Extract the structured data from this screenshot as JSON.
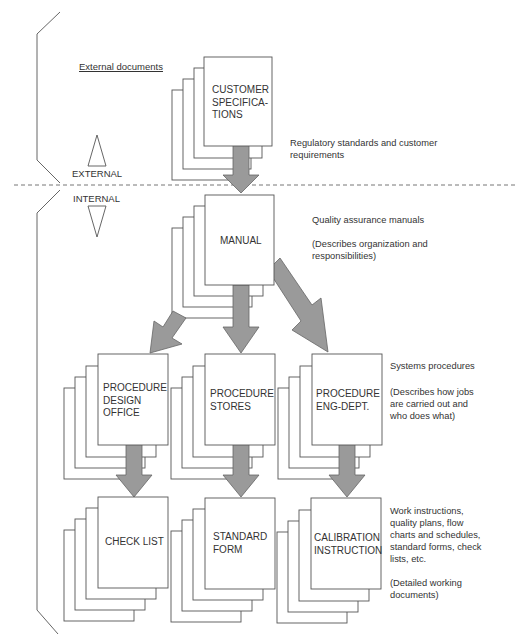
{
  "zones": {
    "external_label": "EXTERNAL",
    "internal_label": "INTERNAL",
    "external_documents_heading": "External documents"
  },
  "levels": [
    {
      "id": "external",
      "documents": [
        {
          "label_lines": [
            "CUSTOMER",
            "SPECIFICA-",
            "TIONS"
          ]
        }
      ],
      "description": "Regulatory standards and customer requirements",
      "description_lines": [
        "Regulatory standards and customer",
        "requirements"
      ]
    },
    {
      "id": "manual",
      "documents": [
        {
          "label_lines": [
            "MANUAL"
          ]
        }
      ],
      "description_title": "Quality assurance manuals",
      "description_lines": [
        "(Describes organization and",
        "responsibilities)"
      ]
    },
    {
      "id": "procedures",
      "documents": [
        {
          "label_lines": [
            "PROCEDURE",
            "DESIGN",
            "OFFICE"
          ]
        },
        {
          "label_lines": [
            "PROCEDURE",
            "STORES"
          ]
        },
        {
          "label_lines": [
            "PROCEDURE",
            "ENG-DEPT."
          ]
        }
      ],
      "description_title": "Systems procedures",
      "description_lines": [
        "(Describes how jobs",
        "are carried out and",
        "who does what)"
      ]
    },
    {
      "id": "work_instructions",
      "documents": [
        {
          "label_lines": [
            "CHECK LIST"
          ]
        },
        {
          "label_lines": [
            "STANDARD",
            "FORM"
          ]
        },
        {
          "label_lines": [
            "CALIBRATION",
            "INSTRUCTION"
          ]
        }
      ],
      "description_lines": [
        "Work instructions,",
        "quality plans, flow",
        "charts and schedules,",
        "standard forms, check",
        "lists, etc."
      ],
      "description_note_lines": [
        "(Detailed working",
        "documents)"
      ]
    }
  ],
  "colors": {
    "line": "#555555",
    "arrow_fill": "#9a9a9a",
    "arrow_stroke": "#666666",
    "dashed": "#777777"
  }
}
